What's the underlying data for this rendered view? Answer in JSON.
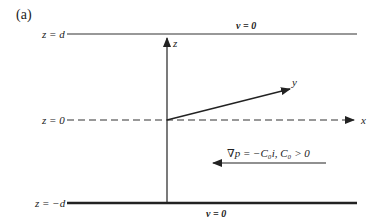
{
  "figure": {
    "panel_label": "(a)",
    "boundaries": {
      "top": {
        "label": "z = d",
        "condition": "v = 0"
      },
      "middle": {
        "label": "z = 0"
      },
      "bottom": {
        "label": "z = −d",
        "condition": "v = 0"
      }
    },
    "axes": {
      "z": "z",
      "y": "y",
      "x": "x"
    },
    "pressure_gradient": {
      "text": "∇p = −C₀i,   C₀ > 0",
      "direction": "negative-x"
    }
  },
  "colors": {
    "line": "#222222",
    "background": "#ffffff"
  }
}
